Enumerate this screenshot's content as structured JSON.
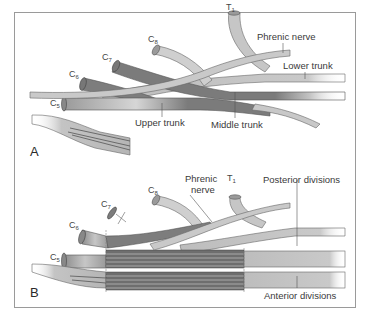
{
  "figure": {
    "panels": [
      {
        "letter": "A",
        "roots": [
          {
            "name": "C",
            "sub": "5"
          },
          {
            "name": "C",
            "sub": "6"
          },
          {
            "name": "C",
            "sub": "7"
          },
          {
            "name": "C",
            "sub": "8"
          },
          {
            "name": "T",
            "sub": "1"
          }
        ],
        "labels": {
          "phrenic_nerve": "Phrenic nerve",
          "lower_trunk": "Lower trunk",
          "upper_trunk": "Upper trunk",
          "middle_trunk": "Middle trunk"
        }
      },
      {
        "letter": "B",
        "roots": [
          {
            "name": "C",
            "sub": "5"
          },
          {
            "name": "C",
            "sub": "6"
          },
          {
            "name": "C",
            "sub": "7"
          },
          {
            "name": "C",
            "sub": "8"
          },
          {
            "name": "T",
            "sub": "1"
          }
        ],
        "labels": {
          "phrenic_line1": "Phrenic",
          "phrenic_line2": "nerve",
          "posterior_divisions": "Posterior divisions",
          "anterior_divisions": "Anterior divisions"
        }
      }
    ],
    "colors": {
      "frame": "#9a9a9a",
      "light_nerve": "#c8c8c8",
      "dark_nerve": "#7e7e7e",
      "outline": "#555555"
    }
  }
}
